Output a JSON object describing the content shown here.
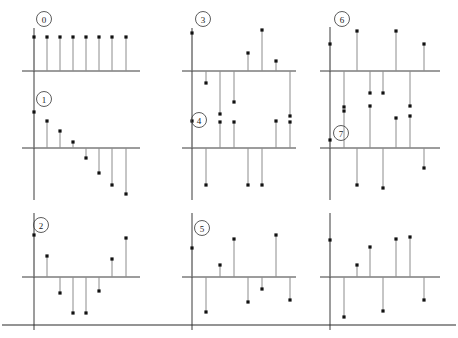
{
  "figure": {
    "title": "",
    "background_color": "#ffffff",
    "width": 458,
    "height": 338,
    "rows": 3,
    "columns": 3,
    "footer_rule": {
      "name": "footer-rule",
      "y": 325,
      "x_start": 2,
      "x_end": 456,
      "color": "#2b2b2b"
    },
    "style": {
      "axis_color": "#3a3a3a",
      "stem_color": "#8c8c8c",
      "marker_color": "#111111",
      "label_circle_color": "#4a4a4a",
      "label_text_color": "#222222"
    }
  },
  "chart_data": {
    "type": "line",
    "plot_kind": "stem",
    "title": "",
    "xlabel": "",
    "ylabel": "",
    "grid": false,
    "legend_position": "none",
    "panels": [
      {
        "id": "panel-0",
        "label": "0",
        "label_visible": true,
        "row": 0,
        "column": 0,
        "baseline_y": 71,
        "axis_x_start": 22,
        "axis_x_end": 140,
        "yaxis_x": 34,
        "yaxis_y_top": 28,
        "yaxis_y_bottom": 84,
        "label_cx": 44,
        "label_cy": 19,
        "x": [
          34,
          47,
          60,
          73,
          86,
          99,
          112,
          126
        ],
        "values_px": [
          -34,
          -34,
          -34,
          -34,
          -34,
          -34,
          -34,
          -34
        ],
        "values": [
          1.0,
          1.0,
          1.0,
          1.0,
          1.0,
          1.0,
          1.0,
          1.0
        ],
        "n": 8
      },
      {
        "id": "panel-1",
        "label": "1",
        "label_visible": true,
        "row": 1,
        "column": 0,
        "baseline_y": 148,
        "axis_x_start": 22,
        "axis_x_end": 140,
        "yaxis_x": 34,
        "yaxis_y_top": 84,
        "yaxis_y_bottom": 200,
        "label_cx": 44,
        "label_cy": 99,
        "x": [
          34,
          47,
          60,
          73,
          86,
          99,
          112,
          126
        ],
        "values_px": [
          -36,
          -27,
          -17,
          -6,
          10,
          25,
          37,
          46
        ],
        "values": [
          0.98,
          0.74,
          0.47,
          0.17,
          -0.27,
          -0.68,
          -1.01,
          -1.26
        ],
        "n": 8
      },
      {
        "id": "panel-2",
        "label": "2",
        "label_visible": true,
        "row": 2,
        "column": 0,
        "baseline_y": 277,
        "axis_x_start": 22,
        "axis_x_end": 140,
        "yaxis_x": 34,
        "yaxis_y_top": 213,
        "yaxis_y_bottom": 330,
        "label_cx": 41,
        "label_cy": 225,
        "x": [
          34,
          47,
          60,
          73,
          86,
          99,
          112,
          126
        ],
        "values_px": [
          -42,
          -21,
          16,
          36,
          36,
          14,
          -18,
          -39
        ],
        "values": [
          1.15,
          0.57,
          -0.44,
          -0.98,
          -0.98,
          -0.38,
          0.49,
          1.07
        ],
        "n": 8
      },
      {
        "id": "panel-3",
        "label": "3",
        "label_visible": true,
        "row": 0,
        "column": 1,
        "baseline_y": 71,
        "axis_x_start": 182,
        "axis_x_end": 296,
        "yaxis_x": 192,
        "yaxis_y_top": 28,
        "yaxis_y_bottom": 84,
        "label_cx": 203,
        "label_cy": 19,
        "x": [
          192,
          206,
          220,
          234,
          248,
          262,
          276,
          290
        ],
        "values_px": [
          -38,
          12,
          43,
          31,
          -18,
          -41,
          -10,
          45
        ],
        "values": [
          1.04,
          -0.33,
          -1.18,
          -0.85,
          0.49,
          1.12,
          0.27,
          -1.23
        ],
        "n": 8
      },
      {
        "id": "panel-4",
        "label": "4",
        "label_visible": true,
        "row": 1,
        "column": 1,
        "baseline_y": 148,
        "axis_x_start": 182,
        "axis_x_end": 296,
        "yaxis_x": 192,
        "yaxis_y_top": 84,
        "yaxis_y_bottom": 200,
        "label_cx": 199,
        "label_cy": 120,
        "x": [
          192,
          206,
          220,
          234,
          248,
          262,
          276,
          290
        ],
        "values_px": [
          -27,
          37,
          -26,
          -26,
          37,
          37,
          -27,
          -26
        ],
        "values": [
          0.74,
          -1.01,
          0.71,
          0.71,
          -1.01,
          -1.01,
          0.74,
          0.71
        ],
        "n": 8
      },
      {
        "id": "panel-5",
        "label": "5",
        "label_visible": true,
        "row": 2,
        "column": 1,
        "baseline_y": 277,
        "axis_x_start": 182,
        "axis_x_end": 296,
        "yaxis_x": 192,
        "yaxis_y_top": 213,
        "yaxis_y_bottom": 330,
        "label_cx": 202,
        "label_cy": 228,
        "x": [
          192,
          206,
          220,
          234,
          248,
          262,
          276,
          290
        ],
        "values_px": [
          -29,
          35,
          -12,
          -38,
          25,
          12,
          -42,
          23
        ],
        "values": [
          0.79,
          -0.96,
          0.33,
          1.04,
          -0.68,
          -0.33,
          1.15,
          -0.63
        ],
        "n": 8
      },
      {
        "id": "panel-6",
        "label": "6",
        "label_visible": true,
        "row": 0,
        "column": 2,
        "baseline_y": 71,
        "axis_x_start": 320,
        "axis_x_end": 440,
        "yaxis_x": 330,
        "yaxis_y_top": 27,
        "yaxis_y_bottom": 84,
        "label_cx": 342,
        "label_cy": 19,
        "x": [
          330,
          344,
          357,
          370,
          383,
          396,
          410,
          424
        ],
        "values_px": [
          -27,
          36,
          -40,
          22,
          22,
          -40,
          35,
          -27
        ],
        "values": [
          0.74,
          -0.98,
          1.1,
          -0.6,
          -0.6,
          1.1,
          -0.96,
          0.74
        ],
        "n": 8
      },
      {
        "id": "panel-7",
        "label": "7",
        "label_visible": true,
        "row": 1,
        "column": 2,
        "baseline_y": 148,
        "axis_x_start": 320,
        "axis_x_end": 440,
        "yaxis_x": 330,
        "yaxis_y_top": 84,
        "yaxis_y_bottom": 200,
        "label_cx": 341,
        "label_cy": 133,
        "x": [
          330,
          344,
          357,
          370,
          383,
          396,
          410,
          424
        ],
        "values_px": [
          -8,
          -37,
          37,
          -42,
          40,
          -30,
          -32,
          20
        ],
        "values": [
          0.22,
          -1.01,
          -1.01,
          1.15,
          -1.1,
          0.82,
          0.88,
          -0.55
        ],
        "n": 8
      },
      {
        "id": "panel-8",
        "label": "",
        "label_visible": false,
        "row": 2,
        "column": 2,
        "baseline_y": 277,
        "axis_x_start": 320,
        "axis_x_end": 440,
        "yaxis_x": 330,
        "yaxis_y_top": 213,
        "yaxis_y_bottom": 330,
        "label_cx": 0,
        "label_cy": 0,
        "x": [
          330,
          344,
          357,
          370,
          383,
          396,
          410,
          424
        ],
        "values_px": [
          -37,
          40,
          -12,
          -30,
          34,
          -38,
          -40,
          23
        ],
        "values": [
          1.01,
          -1.1,
          0.33,
          0.82,
          -0.93,
          1.04,
          1.1,
          -0.63
        ],
        "n": 8
      }
    ]
  }
}
